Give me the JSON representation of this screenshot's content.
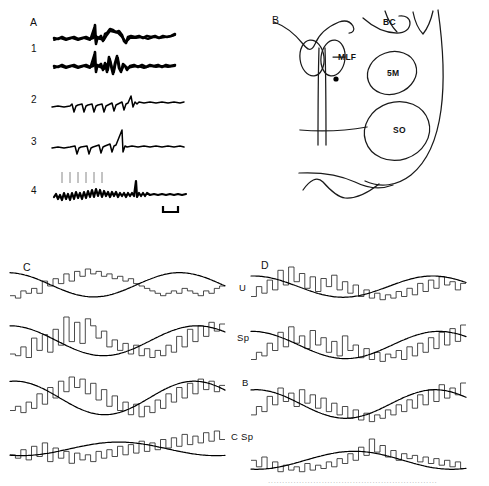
{
  "figure": {
    "width": 489,
    "height": 486,
    "background": "#ffffff",
    "ink_color": "#000000"
  },
  "panels": [
    {
      "id": "A",
      "label": "A",
      "type": "electrophysiology-traces",
      "description": "Superimposed extracellular field potential sweeps evoked by electrical stimulation",
      "traces": [
        {
          "name": "trace-top",
          "label": "",
          "style": "thick-overlaid"
        },
        {
          "name": "trace-1",
          "label": "1",
          "style": "thick-overlaid"
        },
        {
          "name": "trace-2",
          "label": "2",
          "style": "thin-repeated-deflections"
        },
        {
          "name": "trace-3",
          "label": "3",
          "style": "thin-repeated-deflections"
        },
        {
          "name": "trace-4",
          "label": "4",
          "style": "noisy-with-stimulus-marks"
        }
      ],
      "stimulus_marks_count": 6,
      "scalebar": {
        "name": "scale-bar",
        "label": ""
      }
    },
    {
      "id": "B",
      "label": "B",
      "type": "anatomical-section",
      "description": "Outline drawing of a brainstem transverse section with recording site marked",
      "structures": [
        {
          "abbr": "BC",
          "name": "brachium-conjunctivum"
        },
        {
          "abbr": "MLF",
          "name": "medial-longitudinal-fasciculus"
        },
        {
          "abbr": "5M",
          "name": "motor-trigeminal-nucleus"
        },
        {
          "abbr": "SO",
          "name": "superior-olive"
        }
      ],
      "recording_site_marker": "filled-dot"
    },
    {
      "id": "C",
      "label": "C",
      "type": "cycle-histograms",
      "description": "Period histograms of unit firing during sinusoidal stimulation with fitted sine curves",
      "rows": [
        {
          "label": "U",
          "name": "row-u"
        },
        {
          "label": "Sp",
          "name": "row-sp"
        },
        {
          "label": "B",
          "name": "row-b"
        },
        {
          "label": "C Sp",
          "name": "row-c-sp"
        }
      ]
    },
    {
      "id": "D",
      "label": "D",
      "type": "cycle-histograms",
      "description": "Period histograms of unit firing during sinusoidal stimulation with fitted sine curves",
      "rows": [
        {
          "label": "U",
          "name": "row-u"
        },
        {
          "label": "Sp",
          "name": "row-sp"
        },
        {
          "label": "B",
          "name": "row-b"
        },
        {
          "label": "C Sp",
          "name": "row-c-sp"
        }
      ]
    }
  ],
  "row_labels": {
    "u": "U",
    "sp": "Sp",
    "b": "B",
    "csp": "C Sp"
  },
  "anatomy_labels": {
    "bc": "BC",
    "mlf": "MLF",
    "m5": "5M",
    "so": "SO"
  },
  "trace_labels": {
    "a": "A",
    "one": "1",
    "two": "2",
    "three": "3",
    "four": "4"
  },
  "panel_labels": {
    "a": "A",
    "b": "B",
    "c": "C",
    "d": "D"
  },
  "chart_data": [
    {
      "id": "C-U",
      "type": "bar",
      "title": "",
      "xlabel": "",
      "ylabel": "",
      "n_bins": 40,
      "values": [
        3,
        2,
        5,
        4,
        6,
        4,
        9,
        7,
        10,
        8,
        12,
        9,
        13,
        11,
        14,
        12,
        13,
        11,
        12,
        10,
        11,
        9,
        10,
        8,
        7,
        6,
        5,
        4,
        3,
        4,
        5,
        4,
        6,
        5,
        4,
        3,
        5,
        4,
        6,
        7
      ],
      "fit": {
        "type": "sine",
        "amplitude": 5.0,
        "mean": 7.5,
        "phase_deg": 95,
        "cycles": 1.25
      }
    },
    {
      "id": "C-Sp",
      "type": "bar",
      "title": "",
      "xlabel": "",
      "ylabel": "",
      "n_bins": 40,
      "values": [
        4,
        3,
        8,
        2,
        13,
        6,
        15,
        5,
        18,
        9,
        25,
        11,
        22,
        10,
        24,
        20,
        13,
        17,
        8,
        12,
        6,
        10,
        4,
        9,
        3,
        7,
        2,
        6,
        3,
        9,
        5,
        14,
        8,
        18,
        11,
        20,
        14,
        22,
        17,
        21
      ],
      "fit": {
        "type": "sine",
        "amplitude": 8.5,
        "mean": 11.5,
        "phase_deg": 90,
        "cycles": 1.15
      }
    },
    {
      "id": "C-B",
      "type": "bar",
      "title": "",
      "xlabel": "",
      "ylabel": "",
      "n_bins": 40,
      "values": [
        5,
        7,
        4,
        9,
        6,
        13,
        8,
        16,
        11,
        19,
        14,
        21,
        16,
        20,
        13,
        18,
        10,
        15,
        7,
        12,
        5,
        9,
        3,
        8,
        2,
        7,
        4,
        10,
        6,
        13,
        9,
        16,
        11,
        18,
        13,
        20,
        15,
        19,
        14,
        17
      ],
      "fit": {
        "type": "sine",
        "amplitude": 8.0,
        "mean": 11.0,
        "phase_deg": 80,
        "cycles": 1.2
      }
    },
    {
      "id": "C-CSp",
      "type": "bar",
      "title": "",
      "xlabel": "",
      "ylabel": "",
      "n_bins": 40,
      "values": [
        6,
        4,
        9,
        3,
        11,
        5,
        13,
        2,
        10,
        4,
        8,
        1,
        7,
        3,
        6,
        2,
        8,
        4,
        9,
        5,
        11,
        6,
        12,
        7,
        14,
        8,
        13,
        9,
        15,
        10,
        16,
        11,
        18,
        12,
        17,
        13,
        19,
        14,
        20,
        15
      ],
      "fit": {
        "type": "sine",
        "amplitude": 4.0,
        "mean": 9.5,
        "phase_deg": 250,
        "cycles": 1.1
      }
    },
    {
      "id": "D-U",
      "type": "bar",
      "title": "",
      "xlabel": "",
      "ylabel": "",
      "n_bins": 40,
      "values": [
        4,
        10,
        6,
        14,
        8,
        20,
        11,
        22,
        13,
        18,
        9,
        16,
        7,
        15,
        10,
        17,
        8,
        13,
        6,
        11,
        4,
        8,
        3,
        6,
        2,
        5,
        3,
        7,
        4,
        9,
        5,
        12,
        7,
        14,
        9,
        16,
        11,
        13,
        8,
        12
      ],
      "fit": {
        "type": "sine",
        "amplitude": 6.5,
        "mean": 10.0,
        "phase_deg": 85,
        "cycles": 1.2
      }
    },
    {
      "id": "D-Sp",
      "type": "bar",
      "title": "",
      "xlabel": "",
      "ylabel": "",
      "n_bins": 40,
      "values": [
        3,
        7,
        5,
        12,
        8,
        18,
        10,
        21,
        12,
        16,
        9,
        19,
        11,
        15,
        7,
        13,
        5,
        16,
        8,
        11,
        4,
        9,
        3,
        7,
        2,
        6,
        4,
        8,
        3,
        10,
        5,
        12,
        7,
        15,
        9,
        18,
        11,
        20,
        13,
        22
      ],
      "fit": {
        "type": "sine",
        "amplitude": 7.5,
        "mean": 11.0,
        "phase_deg": 88,
        "cycles": 1.15
      }
    },
    {
      "id": "D-B",
      "type": "bar",
      "title": "",
      "xlabel": "",
      "ylabel": "",
      "n_bins": 40,
      "values": [
        6,
        11,
        8,
        17,
        12,
        22,
        14,
        19,
        11,
        21,
        13,
        18,
        10,
        16,
        8,
        13,
        6,
        11,
        4,
        9,
        3,
        7,
        2,
        6,
        4,
        9,
        6,
        12,
        8,
        15,
        10,
        18,
        12,
        21,
        14,
        24,
        16,
        22,
        18,
        25
      ],
      "fit": {
        "type": "sine",
        "amplitude": 8.5,
        "mean": 12.5,
        "phase_deg": 80,
        "cycles": 1.2
      }
    },
    {
      "id": "D-CSp",
      "type": "bar",
      "title": "",
      "xlabel": "",
      "ylabel": "",
      "n_bins": 40,
      "values": [
        9,
        5,
        11,
        4,
        8,
        2,
        6,
        3,
        5,
        2,
        7,
        3,
        6,
        4,
        8,
        5,
        10,
        7,
        13,
        9,
        17,
        12,
        22,
        14,
        18,
        11,
        15,
        9,
        13,
        10,
        12,
        8,
        11,
        7,
        10,
        6,
        9,
        5,
        8,
        4
      ],
      "fit": {
        "type": "sine",
        "amplitude": 5.5,
        "mean": 9.0,
        "phase_deg": 260,
        "cycles": 1.1
      }
    }
  ]
}
